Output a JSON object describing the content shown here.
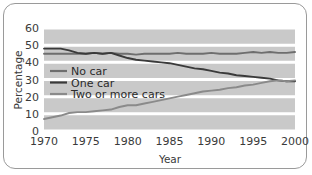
{
  "chart_data": {
    "type": "line",
    "title": "",
    "xlabel": "Year",
    "ylabel": "Percentage",
    "xlim": [
      1970,
      2000
    ],
    "ylim": [
      0,
      60
    ],
    "xticks": [
      "1970",
      "1975",
      "1980",
      "1985",
      "1990",
      "1995",
      "2000"
    ],
    "yticks": [
      "0",
      "10",
      "20",
      "30",
      "40",
      "50",
      "60"
    ],
    "grid": "horizontal-white-bands",
    "legend_position": "inside-left",
    "x": [
      1970,
      1971,
      1972,
      1973,
      1974,
      1975,
      1976,
      1977,
      1978,
      1979,
      1980,
      1981,
      1982,
      1983,
      1984,
      1985,
      1986,
      1987,
      1988,
      1989,
      1990,
      1991,
      1992,
      1993,
      1994,
      1995,
      1996,
      1997,
      1998,
      1999,
      2000
    ],
    "series": [
      {
        "name": "No car",
        "color": "#6e6e6e",
        "values": [
          45,
          45,
          45,
          45,
          45,
          45,
          45.5,
          45,
          45.5,
          45,
          45,
          44.5,
          45,
          45,
          45,
          45,
          45.5,
          45,
          45,
          45,
          45.5,
          45,
          45,
          45,
          45.5,
          46,
          45.5,
          46,
          45.5,
          45.5,
          46
        ]
      },
      {
        "name": "One car",
        "color": "#3a3a3a",
        "values": [
          48,
          48,
          48,
          47,
          45.5,
          45,
          45.5,
          45,
          45.5,
          44,
          42.5,
          41.5,
          41,
          40.5,
          40,
          39.5,
          38.5,
          37.5,
          36.5,
          36,
          35,
          34,
          33.5,
          32.5,
          32,
          31.5,
          31,
          30.5,
          29.5,
          29,
          29
        ]
      },
      {
        "name": "Two or more cars",
        "color": "#8a8a8a",
        "values": [
          7,
          8,
          9,
          10.5,
          11,
          11,
          11.5,
          12,
          12.5,
          14,
          15,
          15,
          16,
          17,
          18,
          19,
          20,
          21,
          22,
          23,
          23.5,
          24,
          25,
          25.5,
          26.5,
          27,
          28,
          29,
          29.5,
          29,
          29.5
        ]
      }
    ]
  },
  "legend": {
    "items": [
      {
        "label": "No car"
      },
      {
        "label": "One car"
      },
      {
        "label": "Two or more cars"
      }
    ]
  },
  "axes": {
    "y_title": "Percentage",
    "x_title": "Year"
  },
  "colors": {
    "plot_background": "#c9c9c9",
    "gridline": "#ffffff",
    "frame_border": "#9a9a9a",
    "no_car": "#6e6e6e",
    "one_car": "#3a3a3a",
    "two_or_more_cars": "#8a8a8a"
  }
}
